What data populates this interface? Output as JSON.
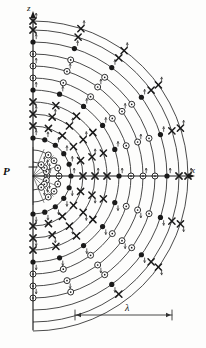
{
  "figure": {
    "kind": "wavefront-radiation-diagram",
    "background_color": "#fdfdfc",
    "ink_color": "#1a1a1a",
    "width": 206,
    "height": 348
  },
  "axes": {
    "vertical": {
      "label": "z",
      "name": "z-axis",
      "x": 33,
      "y_top": 18,
      "y_bottom": 330,
      "arrow": "up",
      "tick_at_origin": true
    },
    "horizontal": {
      "label": "x",
      "name": "x-axis",
      "y": 176,
      "x_left": 33,
      "x_right": 188,
      "arrow": "right"
    },
    "origin": {
      "label": "P",
      "name": "source-point-P",
      "x": 33,
      "y": 176
    }
  },
  "scale_bar": {
    "label": "λ",
    "name": "wavelength-scale-bar",
    "y": 315,
    "x_start": 75,
    "x_end": 172,
    "arrow_both_ends": true
  },
  "wavefronts": {
    "name": "concentric-wavefront-arcs",
    "center_x": 33,
    "center_y": 176,
    "count": 13,
    "radii": [
      14,
      26,
      38,
      50,
      62,
      74,
      86,
      98,
      110,
      122,
      134,
      146,
      155
    ],
    "stroke_width": 0.85,
    "color": "#2b2b2b",
    "span_degrees": 180,
    "orientation": "right half-plane"
  },
  "markers": {
    "legend": [
      {
        "symbol": "filled-circle",
        "name": "filled-circle-marker",
        "meaning": "field maximum / node",
        "color": "#111111"
      },
      {
        "symbol": "circle-dot",
        "name": "circle-dot-marker",
        "meaning": "field out of page",
        "color": "#111111"
      },
      {
        "symbol": "cross",
        "name": "cross-marker",
        "meaning": "field into page",
        "color": "#111111"
      },
      {
        "symbol": "arrow-tick",
        "name": "arrow-tick-marker",
        "meaning": "field vector direction",
        "color": "#444444"
      }
    ],
    "axis_sequence": [
      {
        "r": 14,
        "type": "circle-dot"
      },
      {
        "r": 26,
        "type": "circle-dot"
      },
      {
        "r": 38,
        "type": "filled-circle"
      },
      {
        "r": 50,
        "type": "cross"
      },
      {
        "r": 62,
        "type": "cross"
      },
      {
        "r": 74,
        "type": "cross"
      },
      {
        "r": 86,
        "type": "filled-circle"
      },
      {
        "r": 98,
        "type": "circle-dot"
      },
      {
        "r": 110,
        "type": "circle-dot"
      },
      {
        "r": 122,
        "type": "circle-dot"
      },
      {
        "r": 134,
        "type": "filled-circle"
      },
      {
        "r": 146,
        "type": "cross"
      },
      {
        "r": 155,
        "type": "cross"
      }
    ],
    "radial_rays_degrees": [
      0,
      18,
      36,
      54,
      72,
      90,
      108,
      126,
      144,
      162,
      180
    ]
  },
  "inner_fan": {
    "name": "inner-ray-fan",
    "description": "short straight rays from P to the innermost marker ring",
    "count": 9
  }
}
